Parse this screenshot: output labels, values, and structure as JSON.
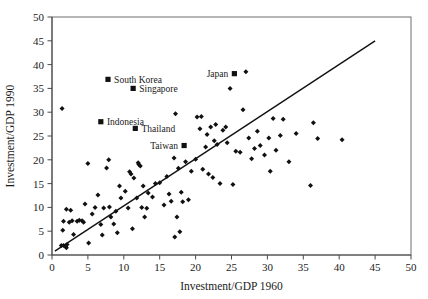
{
  "chart_data": {
    "type": "scatter",
    "title": "",
    "xlabel": "Investment/GDP 1960",
    "ylabel": "Investment/GDP 1990",
    "xlim": [
      0,
      50
    ],
    "ylim": [
      0,
      50
    ],
    "xticks": [
      0,
      5,
      10,
      15,
      20,
      25,
      30,
      35,
      40,
      45,
      50
    ],
    "yticks": [
      0,
      5,
      10,
      15,
      20,
      25,
      30,
      35,
      40,
      45,
      50
    ],
    "xtick_labels": [
      "0",
      "5",
      "10",
      "15",
      "20",
      "25",
      "30",
      "35",
      "40",
      "45",
      "50"
    ],
    "ytick_labels": [
      "0",
      "5",
      "10",
      "15",
      "20",
      "25",
      "30",
      "35",
      "40",
      "45",
      "50"
    ],
    "grid": false,
    "legend": null,
    "legend_position": "none",
    "fit_line": {
      "name": "45-degree reference line",
      "x": [
        0.4,
        45.0
      ],
      "y": [
        0.8,
        45.0
      ]
    },
    "series": [
      {
        "name": "Countries",
        "marker": "diamond",
        "color": "#111111",
        "points": [
          [
            1.4,
            30.8
          ],
          [
            1.3,
            2.0
          ],
          [
            1.6,
            2.0
          ],
          [
            1.9,
            1.8
          ],
          [
            2.1,
            2.2
          ],
          [
            2.0,
            1.5
          ],
          [
            1.5,
            5.2
          ],
          [
            1.6,
            7.1
          ],
          [
            2.0,
            9.6
          ],
          [
            2.6,
            9.4
          ],
          [
            2.4,
            6.9
          ],
          [
            2.8,
            7.2
          ],
          [
            3.0,
            4.3
          ],
          [
            3.5,
            7.1
          ],
          [
            3.8,
            7.3
          ],
          [
            4.2,
            7.2
          ],
          [
            4.4,
            6.9
          ],
          [
            4.6,
            10.7
          ],
          [
            5.0,
            19.2
          ],
          [
            5.1,
            2.5
          ],
          [
            5.6,
            8.6
          ],
          [
            6.0,
            10.0
          ],
          [
            6.4,
            12.6
          ],
          [
            6.8,
            6.4
          ],
          [
            7.0,
            4.2
          ],
          [
            7.2,
            9.9
          ],
          [
            7.6,
            18.3
          ],
          [
            7.9,
            20.0
          ],
          [
            8.0,
            10.1
          ],
          [
            8.2,
            8.0
          ],
          [
            8.6,
            6.5
          ],
          [
            8.9,
            9.2
          ],
          [
            9.1,
            4.7
          ],
          [
            9.4,
            14.5
          ],
          [
            9.6,
            12.0
          ],
          [
            10.2,
            13.4
          ],
          [
            10.6,
            9.9
          ],
          [
            10.8,
            17.5
          ],
          [
            11.0,
            17.0
          ],
          [
            11.2,
            5.5
          ],
          [
            11.4,
            16.2
          ],
          [
            11.8,
            12.0
          ],
          [
            12.1,
            19.0
          ],
          [
            12.3,
            18.7
          ],
          [
            12.5,
            10.0
          ],
          [
            12.7,
            14.5
          ],
          [
            12.9,
            8.0
          ],
          [
            13.2,
            9.8
          ],
          [
            13.4,
            13.0
          ],
          [
            14.0,
            12.2
          ],
          [
            14.4,
            15.0
          ],
          [
            15.0,
            15.2
          ],
          [
            15.6,
            10.5
          ],
          [
            16.0,
            16.5
          ],
          [
            16.3,
            12.8
          ],
          [
            16.6,
            11.3
          ],
          [
            17.0,
            20.4
          ],
          [
            17.1,
            3.8
          ],
          [
            17.4,
            8.0
          ],
          [
            17.6,
            18.2
          ],
          [
            17.8,
            4.9
          ],
          [
            18.0,
            13.2
          ],
          [
            18.2,
            11.2
          ],
          [
            18.6,
            19.6
          ],
          [
            19.0,
            11.6
          ],
          [
            19.4,
            17.6
          ],
          [
            20.0,
            20.1
          ],
          [
            20.2,
            29.0
          ],
          [
            20.6,
            26.5
          ],
          [
            21.0,
            18.0
          ],
          [
            21.4,
            22.7
          ],
          [
            21.6,
            25.3
          ],
          [
            21.8,
            17.0
          ],
          [
            22.1,
            26.9
          ],
          [
            22.4,
            16.3
          ],
          [
            22.6,
            24.0
          ],
          [
            22.8,
            27.4
          ],
          [
            23.0,
            23.2
          ],
          [
            23.4,
            15.0
          ],
          [
            23.8,
            26.2
          ],
          [
            24.2,
            26.9
          ],
          [
            24.4,
            23.6
          ],
          [
            24.8,
            35.0
          ],
          [
            25.2,
            14.8
          ],
          [
            25.6,
            21.8
          ],
          [
            26.2,
            21.6
          ],
          [
            26.6,
            30.5
          ],
          [
            27.0,
            38.5
          ],
          [
            27.4,
            24.6
          ],
          [
            27.8,
            20.2
          ],
          [
            28.2,
            22.4
          ],
          [
            28.6,
            26.0
          ],
          [
            29.0,
            23.0
          ],
          [
            29.6,
            21.0
          ],
          [
            30.2,
            24.6
          ],
          [
            30.4,
            17.6
          ],
          [
            30.8,
            28.7
          ],
          [
            31.2,
            22.0
          ],
          [
            31.8,
            25.1
          ],
          [
            32.2,
            28.5
          ],
          [
            33.0,
            19.6
          ],
          [
            34.0,
            25.5
          ],
          [
            36.0,
            14.6
          ],
          [
            36.4,
            27.8
          ],
          [
            37.0,
            24.5
          ],
          [
            40.4,
            24.2
          ],
          [
            17.2,
            29.7
          ],
          [
            20.8,
            29.1
          ],
          [
            12.0,
            19.4
          ]
        ]
      }
    ],
    "annotations": [
      {
        "label": "South Korea",
        "x": 7.8,
        "y": 36.9,
        "marker": "square",
        "text_side": "right"
      },
      {
        "label": "Singapore",
        "x": 11.3,
        "y": 35.0,
        "marker": "square",
        "text_side": "right"
      },
      {
        "label": "Indonesia",
        "x": 6.8,
        "y": 28.0,
        "marker": "square",
        "text_side": "right"
      },
      {
        "label": "Thailand",
        "x": 11.6,
        "y": 26.6,
        "marker": "square",
        "text_side": "right"
      },
      {
        "label": "Taiwan",
        "x": 18.4,
        "y": 23.0,
        "marker": "square",
        "text_side": "left"
      },
      {
        "label": "Japan",
        "x": 25.4,
        "y": 38.1,
        "marker": "square",
        "text_side": "left"
      }
    ]
  }
}
